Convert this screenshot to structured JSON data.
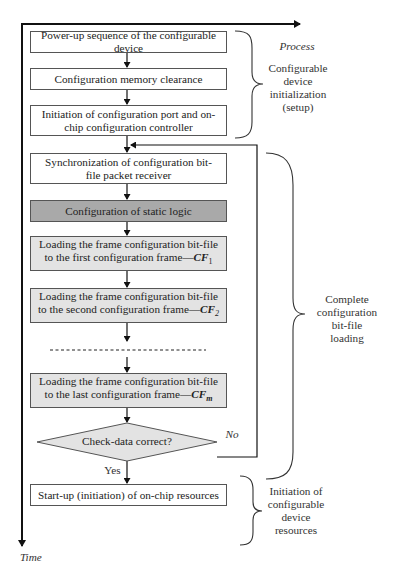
{
  "axes": {
    "time_label": "Time"
  },
  "steps": [
    {
      "id": "power-up",
      "text": "Power-up sequence of the configurable device",
      "fill": "#ffffff"
    },
    {
      "id": "memory-clear",
      "text": "Configuration memory clearance",
      "fill": "#ffffff"
    },
    {
      "id": "port-init",
      "text": "Initiation of configuration port and on-chip configuration controller",
      "fill": "#ffffff"
    },
    {
      "id": "sync",
      "text": "Synchronization of configuration bit-file packet receiver",
      "fill": "#ffffff"
    },
    {
      "id": "static-logic",
      "text": "Configuration of static logic",
      "fill": "#a9a9a9"
    },
    {
      "id": "load-first",
      "text": "Loading the frame configuration bit-file to the first configuration frame—",
      "frame": "CF",
      "sub": "1",
      "fill": "#e3e3e3"
    },
    {
      "id": "load-second",
      "text": "Loading the frame configuration bit-file to the second configuration frame—",
      "frame": "CF",
      "sub": "2",
      "fill": "#e3e3e3"
    },
    {
      "id": "load-last",
      "text": "Loading the frame configuration bit-file to the last configuration frame—",
      "frame": "CF",
      "sub": "m",
      "fill": "#e3e3e3"
    },
    {
      "id": "startup",
      "text": "Start-up (initiation) of on-chip resources",
      "fill": "#ffffff"
    }
  ],
  "decision": {
    "text": "Check-data correct?",
    "yes_label": "Yes",
    "no_label": "No",
    "fill": "#e3e3e3"
  },
  "phases": [
    {
      "heading": "Process",
      "text": "Configurable device initialization (setup)"
    },
    {
      "text": "Complete configuration bit-file loading"
    },
    {
      "text": "Initiation of configurable device resources"
    }
  ]
}
